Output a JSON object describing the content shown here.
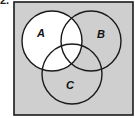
{
  "question": {
    "number_label": "2."
  },
  "venn": {
    "universe": {
      "x": 14,
      "y": 2,
      "width": 119,
      "height": 113,
      "fill": "#cfcfcf",
      "stroke": "#1a1a1a"
    },
    "shaded_color": "#cfcfcf",
    "unshaded_color": "#ffffff",
    "outline_color": "#1a1a1a",
    "shaded_region_description": "complement of A (A is unshaded; everything outside A is shaded)",
    "sets": [
      {
        "id": "A",
        "label": "A",
        "cx": 52,
        "cy": 41,
        "r": 30,
        "label_x": 41,
        "label_y": 37,
        "unshaded": true
      },
      {
        "id": "B",
        "label": "B",
        "cx": 91,
        "cy": 41,
        "r": 30,
        "label_x": 101,
        "label_y": 38,
        "unshaded": false
      },
      {
        "id": "C",
        "label": "C",
        "cx": 72,
        "cy": 74,
        "r": 30,
        "label_x": 70,
        "label_y": 89,
        "unshaded": false
      }
    ]
  }
}
